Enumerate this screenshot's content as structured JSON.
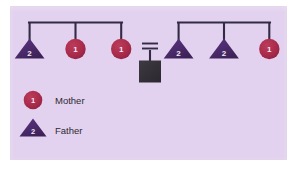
{
  "diagram": {
    "background_color": "#e3d2ef",
    "page_color": "#ffffff",
    "line_color": "#332a46",
    "mother_color": "#a92a4a",
    "father_color": "#4b2a6b",
    "proband_color": "#34313a",
    "label_text_color": "#2d2a30",
    "symbol_text_color": "#f3e9f7"
  },
  "left_family": {
    "name": "left-sibship",
    "members": [
      {
        "shape": "triangle",
        "label": "2",
        "role": "Father",
        "color": "#4b2a6b"
      },
      {
        "shape": "circle",
        "label": "1",
        "role": "Mother",
        "color": "#a92a4a"
      },
      {
        "shape": "circle",
        "label": "1",
        "role": "Mother",
        "color": "#a92a4a"
      }
    ]
  },
  "right_family": {
    "name": "right-sibship",
    "members": [
      {
        "shape": "triangle",
        "label": "2",
        "role": "Father",
        "color": "#4b2a6b"
      },
      {
        "shape": "triangle",
        "label": "2",
        "role": "Father",
        "color": "#4b2a6b"
      },
      {
        "shape": "circle",
        "label": "1",
        "role": "Mother",
        "color": "#a92a4a"
      }
    ]
  },
  "union": {
    "name": "mating-union",
    "symbol": "=",
    "offspring_shape": "square",
    "offspring_label": "",
    "offspring_color": "#34313a"
  },
  "legend": {
    "items": [
      {
        "shape": "circle",
        "label": "1",
        "text": "Mother",
        "color": "#a92a4a"
      },
      {
        "shape": "triangle",
        "label": "2",
        "text": "Father",
        "color": "#4b2a6b"
      }
    ]
  }
}
